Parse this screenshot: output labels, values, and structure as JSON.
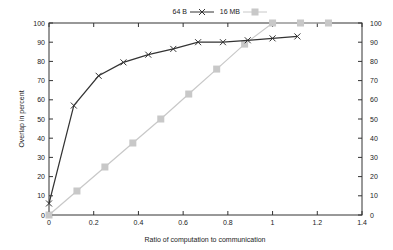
{
  "chart_data": {
    "type": "line",
    "title": "",
    "xlabel": "Ratio of computation to communication",
    "ylabel": "Overlap in percent",
    "xlim": [
      0,
      1.4
    ],
    "ylim": [
      0,
      100
    ],
    "x_ticks": [
      "0",
      "0.2",
      "0.4",
      "0.6",
      "0.8",
      "1",
      "1.2",
      "1.4"
    ],
    "y_ticks": [
      "0",
      "10",
      "20",
      "30",
      "40",
      "50",
      "60",
      "70",
      "80",
      "90",
      "100"
    ],
    "y2_ticks": [
      "0",
      "10",
      "20",
      "30",
      "40",
      "50",
      "60",
      "70",
      "80",
      "90",
      "100"
    ],
    "grid": false,
    "legend_position": "top-center",
    "series": [
      {
        "name": "64 B",
        "marker": "x",
        "color": "#333333",
        "x": [
          0,
          0.111,
          0.222,
          0.333,
          0.444,
          0.556,
          0.667,
          0.778,
          0.889,
          1.0,
          1.111
        ],
        "y": [
          6,
          57,
          72.5,
          79.5,
          83.5,
          86.5,
          90,
          90,
          91,
          92,
          93
        ]
      },
      {
        "name": "16 MB",
        "marker": "square",
        "color": "#c8c8c8",
        "x": [
          0,
          0.125,
          0.25,
          0.375,
          0.5,
          0.625,
          0.75,
          0.875,
          1.0,
          1.125,
          1.25
        ],
        "y": [
          0,
          12.5,
          25,
          37.5,
          50,
          63,
          76,
          89,
          100,
          100,
          100
        ]
      }
    ]
  }
}
